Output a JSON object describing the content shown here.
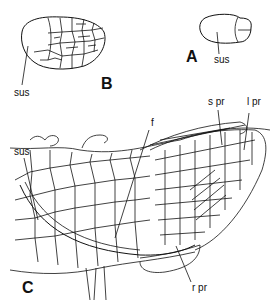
{
  "figure": {
    "panels": [
      {
        "id": "A",
        "label": "A",
        "labels": [
          "sus"
        ]
      },
      {
        "id": "B",
        "label": "B",
        "labels": [
          "sus"
        ]
      },
      {
        "id": "C",
        "label": "C",
        "labels": [
          "sus",
          "f",
          "s pr",
          "l pr",
          "r pr"
        ]
      }
    ],
    "labels": {
      "panel_a": "A",
      "panel_b": "B",
      "panel_c": "C",
      "sus_a": "sus",
      "sus_b": "sus",
      "f": "f",
      "s_pr": "s pr",
      "l_pr": "l pr",
      "r_pr": "r pr"
    },
    "line_color": "#111111",
    "background": "#ffffff"
  }
}
